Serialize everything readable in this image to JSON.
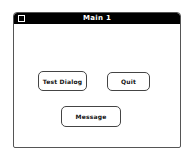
{
  "window": {
    "title": "Main 1",
    "close_box_icon": "close-box-icon"
  },
  "buttons": {
    "test_dialog": "Test Dialog",
    "quit": "Quit",
    "message": "Message"
  },
  "colors": {
    "titlebar": "#000000",
    "title_text": "#ffffff",
    "background": "#ffffff",
    "border": "#444444"
  }
}
